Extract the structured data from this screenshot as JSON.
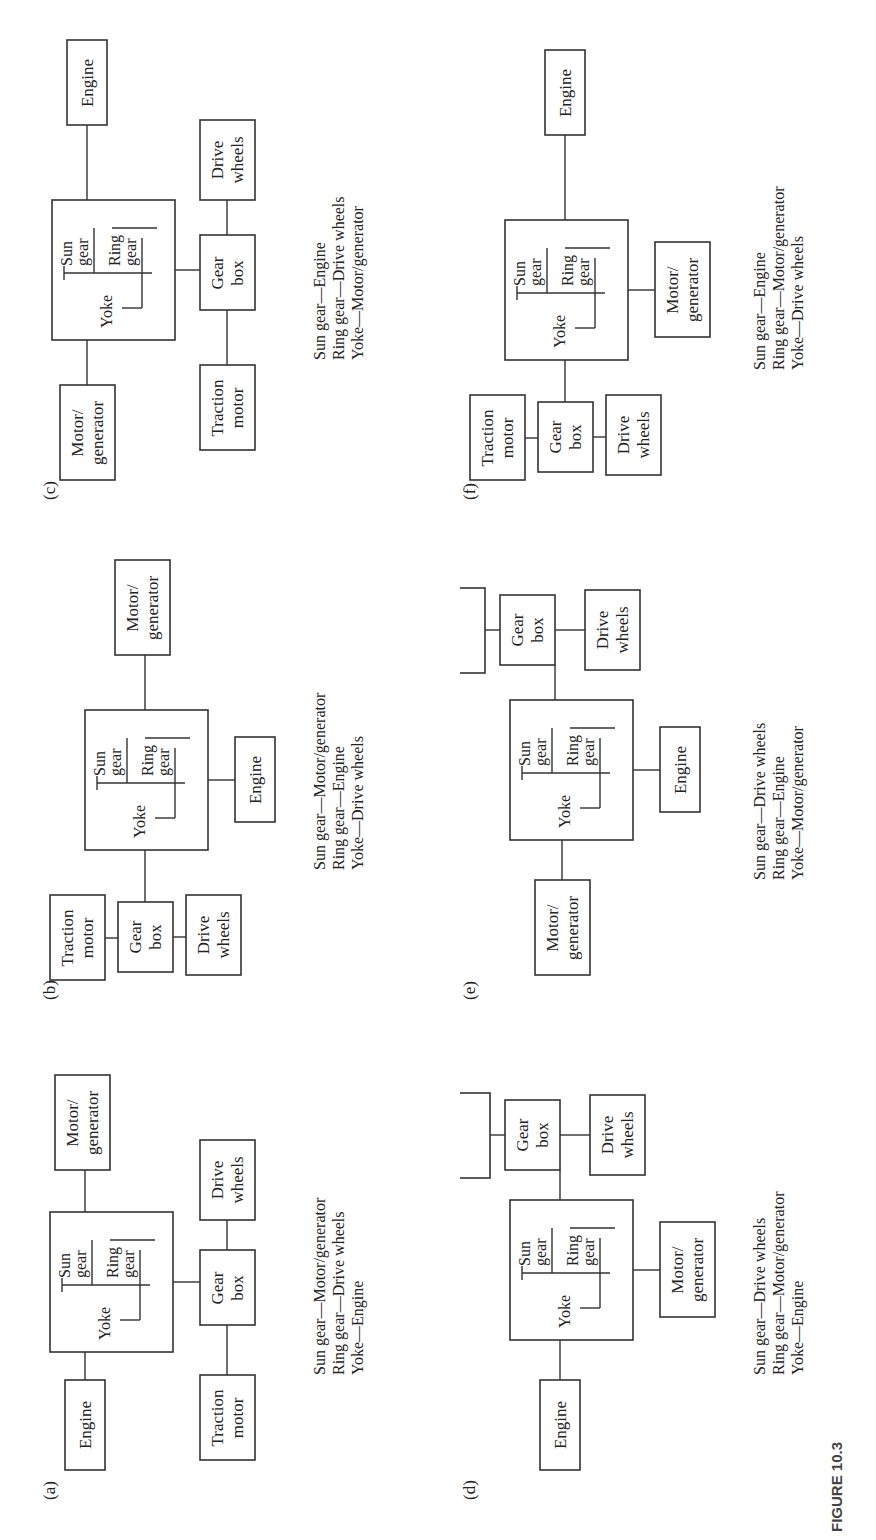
{
  "figure_label": "FIGURE 10.3",
  "panels": [
    {
      "id": "a",
      "label": "(a)",
      "left": "Engine",
      "right": "Motor/ generator",
      "bottom_connection": "gearbox",
      "caption": [
        "Sun gear—Motor/generator",
        "Ring gear—Drive wheels",
        "Yoke—Engine"
      ]
    },
    {
      "id": "b",
      "label": "(b)",
      "caption": [
        "Sun gear—Motor/generator",
        "Ring gear—Engine",
        "Yoke—Drive wheels"
      ]
    },
    {
      "id": "c",
      "label": "(c)",
      "caption": [
        "Sun gear—Engine",
        "Ring gear—Drive wheels",
        "Yoke—Motor/generator"
      ]
    },
    {
      "id": "d",
      "label": "(d)",
      "caption": [
        "Sun gear—Drive wheels",
        "Ring gear—Motor/generator",
        "Yoke—Engine"
      ]
    },
    {
      "id": "e",
      "label": "(e)",
      "caption": [
        "Sun gear—Drive wheels",
        "Ring gear—Engine",
        "Yoke—Motor/generator"
      ]
    },
    {
      "id": "f",
      "label": "(f)",
      "caption": [
        "Sun gear—Engine",
        "Ring gear—Motor/generator",
        "Yoke—Drive wheels"
      ]
    }
  ],
  "labels": {
    "engine": "Engine",
    "motor_generator_1": "Motor/",
    "motor_generator_2": "generator",
    "traction_motor_1": "Traction",
    "traction_motor_2": "motor",
    "gear_box_1": "Gear",
    "gear_box_2": "box",
    "drive_wheels_1": "Drive",
    "drive_wheels_2": "wheels",
    "sun_gear_1": "Sun",
    "sun_gear_2": "gear",
    "ring_gear_1": "Ring",
    "ring_gear_2": "gear",
    "yoke": "Yoke"
  }
}
